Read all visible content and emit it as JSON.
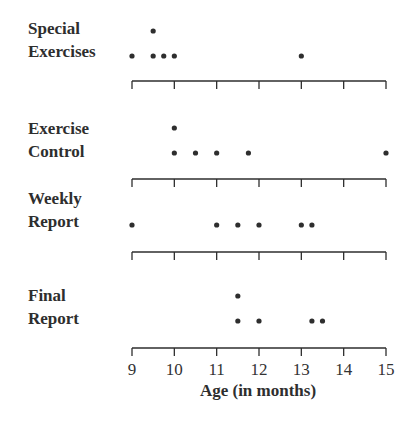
{
  "chart_data": {
    "type": "dot_plot",
    "title": "",
    "xlabel": "Age (in months)",
    "ylabel": "",
    "xlim": [
      9,
      15
    ],
    "x_ticks": [
      9,
      10,
      11,
      12,
      13,
      14,
      15
    ],
    "grid": false,
    "legend": null,
    "series": [
      {
        "name": "Special Exercises",
        "label_lines": [
          "Special",
          "Exercises"
        ],
        "values": [
          9,
          9.5,
          9.5,
          9.75,
          10,
          13
        ]
      },
      {
        "name": "Exercise Control",
        "label_lines": [
          "Exercise",
          "Control"
        ],
        "values": [
          10,
          10,
          10.5,
          11,
          11.75,
          15
        ]
      },
      {
        "name": "Weekly Report",
        "label_lines": [
          "Weekly",
          "Report"
        ],
        "values": [
          9,
          11,
          11.5,
          12,
          13,
          13.25
        ]
      },
      {
        "name": "Final Report",
        "label_lines": [
          "Final",
          "Report"
        ],
        "values": [
          11.5,
          11.5,
          12,
          13.25,
          13.5
        ]
      }
    ]
  },
  "colors": {
    "ink": "#2e2e2e",
    "background": "#ffffff"
  }
}
